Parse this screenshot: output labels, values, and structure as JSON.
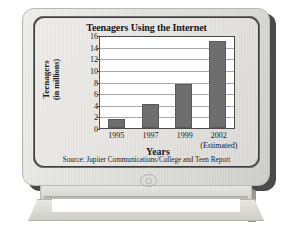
{
  "figure": {
    "device": "computer-monitor",
    "emblem": "power-emblem"
  },
  "chart_data": {
    "type": "bar",
    "title": "Teenagers Using the Internet",
    "xlabel": "Years",
    "ylabel": "Teenagers (in millions)",
    "ylabel_line1": "Teenagers",
    "ylabel_line2": "(in millions)",
    "categories": [
      "1995",
      "1997",
      "1999",
      "2002"
    ],
    "category_notes": [
      "",
      "",
      "",
      "(Estimated)"
    ],
    "values": [
      1.5,
      4.2,
      7.8,
      15.3
    ],
    "ylim": [
      0,
      16
    ],
    "yticks": [
      0,
      2,
      4,
      6,
      8,
      10,
      12,
      14,
      16
    ],
    "ytick_labels": [
      "0",
      "2",
      "4",
      "6",
      "8",
      "10",
      "12",
      "14",
      "16"
    ],
    "grid": true,
    "legend": "none",
    "source": "Source: Jupiter Communications/College and Teen Report",
    "bar_color": "#6e6e6e",
    "plot_background": "#ffffff",
    "grid_color": "#a9a9a9",
    "text_color": "#17171a"
  }
}
